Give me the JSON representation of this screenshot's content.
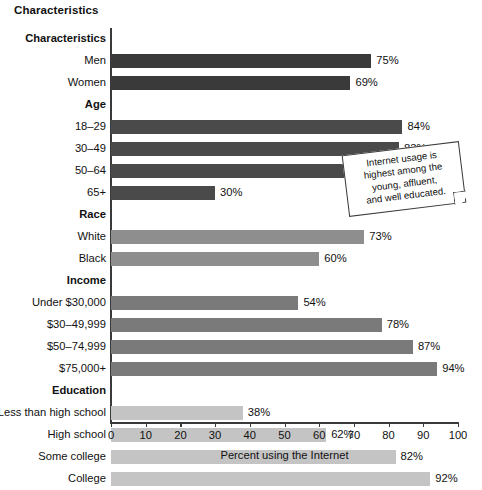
{
  "chart_data": {
    "type": "bar",
    "orientation": "horizontal",
    "title": "",
    "xlabel": "Percent using the Internet",
    "ylabel": "Characteristics",
    "xlim": [
      0,
      100
    ],
    "grid": false,
    "legend": null,
    "xticks": [
      0,
      10,
      20,
      30,
      40,
      50,
      60,
      70,
      80,
      90,
      100
    ],
    "xtick_labels": [
      "0",
      "10",
      "20",
      "30",
      "40",
      "50",
      "60",
      "70",
      "80",
      "90",
      "100"
    ],
    "groups": [
      {
        "name": "Characteristics",
        "is_header": true,
        "color": "#3a3a3a",
        "categories": [
          "Men",
          "Women"
        ],
        "values": [
          75,
          69
        ],
        "value_labels": [
          "75%",
          "69%"
        ]
      },
      {
        "name": "Age",
        "is_header": true,
        "color": "#4a4a4a",
        "categories": [
          "18–29",
          "30–49",
          "50–64",
          "65+"
        ],
        "values": [
          84,
          83,
          71,
          30
        ],
        "value_labels": [
          "84%",
          "83%",
          "71%",
          "30%"
        ]
      },
      {
        "name": "Race",
        "is_header": true,
        "color": "#8e8e8e",
        "categories": [
          "White",
          "Black"
        ],
        "values": [
          73,
          60
        ],
        "value_labels": [
          "73%",
          "60%"
        ]
      },
      {
        "name": "Income",
        "is_header": true,
        "color": "#7a7a7a",
        "categories": [
          "Under $30,000",
          "$30–49,999",
          "$50–74,999",
          "$75,000+"
        ],
        "values": [
          54,
          78,
          87,
          94
        ],
        "value_labels": [
          "54%",
          "78%",
          "87%",
          "94%"
        ]
      },
      {
        "name": "Education",
        "is_header": true,
        "color": "#c4c4c4",
        "categories": [
          "Less than high school",
          "High school",
          "Some college",
          "College"
        ],
        "values": [
          38,
          62,
          82,
          92
        ],
        "value_labels": [
          "38%",
          "62%",
          "82%",
          "92%"
        ]
      }
    ],
    "categories": [
      "Men",
      "Women",
      "18–29",
      "30–49",
      "50–64",
      "65+",
      "White",
      "Black",
      "Under $30,000",
      "$30–49,999",
      "$50–74,999",
      "$75,000+",
      "Less than high school",
      "High school",
      "Some college",
      "College"
    ],
    "values": [
      75,
      69,
      84,
      83,
      71,
      30,
      73,
      60,
      54,
      78,
      87,
      94,
      38,
      62,
      82,
      92
    ],
    "annotations": [
      {
        "name": "callout-note",
        "text": "Internet usage is highest among the young, affluent, and well educated.",
        "lines": [
          "Internet usage is",
          "highest among the",
          "young, affluent,",
          "and well educated."
        ],
        "rotation_deg": -7
      }
    ]
  },
  "colors": {
    "axis": "#3a3a3a",
    "text": "#111111",
    "background": "#ffffff",
    "bar_characteristics": "#3a3a3a",
    "bar_age": "#4a4a4a",
    "bar_race": "#8e8e8e",
    "bar_income": "#7a7a7a",
    "bar_education": "#c4c4c4"
  }
}
